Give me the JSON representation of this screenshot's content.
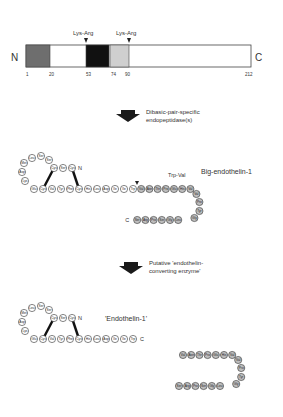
{
  "precursor": {
    "n_label": "N",
    "c_label": "C",
    "bar": {
      "x": 26,
      "y": 45,
      "w": 225,
      "h": 22
    },
    "segments": [
      {
        "from": 26,
        "to": 50,
        "color": "#6e6e6e"
      },
      {
        "from": 86,
        "to": 109,
        "color": "#111111"
      },
      {
        "from": 110,
        "to": 129,
        "color": "#cfcfcf"
      }
    ],
    "cleavage_sites": [
      {
        "label": "Lys-Arg",
        "x": 86
      },
      {
        "label": "Lys-Arg",
        "x": 129
      }
    ],
    "positions": [
      {
        "label": "1",
        "x": 28
      },
      {
        "label": "20",
        "x": 51
      },
      {
        "label": "53",
        "x": 88
      },
      {
        "label": "74",
        "x": 113
      },
      {
        "label": "90",
        "x": 127
      },
      {
        "label": "212",
        "x": 247
      }
    ]
  },
  "step1": {
    "line1": "Dibasic-pair-specific",
    "line2": "endopeptidase(s)"
  },
  "big_et1": {
    "title": "Big-endothelin-1",
    "cleavage_label": "Trp-Val",
    "n_label": "N",
    "c_label": "C"
  },
  "step2": {
    "line1": "Putative 'endothelin-",
    "line2": "converting enzyme'"
  },
  "et1": {
    "title": "'Endothelin-1'",
    "n_label": "N",
    "c_label": "C"
  },
  "sequences": {
    "et1_residues": [
      "Cys",
      "Ser",
      "Cys",
      "Ser",
      "Ser",
      "Leu",
      "Met",
      "Asp",
      "Lys",
      "Glu",
      "Cys",
      "Val",
      "Tyr",
      "Phe",
      "Cys",
      "His",
      "Leu",
      "Asp",
      "Ile",
      "Ile",
      "Trp"
    ],
    "cterm_residues": [
      "Val",
      "Asn",
      "Thr",
      "Pro",
      "Glu",
      "His",
      "Val",
      "Val",
      "Pro",
      "Tyr",
      "Gly",
      "Leu",
      "Gly",
      "Ser",
      "Pro",
      "Arg",
      "Ser"
    ]
  }
}
